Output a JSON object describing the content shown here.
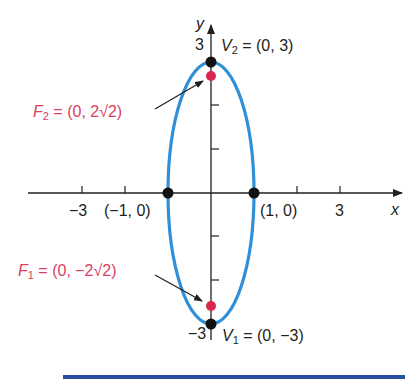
{
  "colors": {
    "ellipse": "#2f8fd8",
    "focus": "#d9274f",
    "vertex": "#111111",
    "axis": "#231f20",
    "focus_label": "#d9405f",
    "bottom_bar": "#2a4f9e"
  },
  "axes": {
    "x_label": "x",
    "y_label": "y",
    "x_ticks": [
      {
        "value": -3,
        "label": "−3"
      },
      {
        "value": -2,
        "label": ""
      },
      {
        "value": 2,
        "label": ""
      },
      {
        "value": 3,
        "label": "3"
      }
    ],
    "y_ticks": [
      {
        "value": 3,
        "label": "3"
      },
      {
        "value": 2,
        "label": ""
      },
      {
        "value": 1,
        "label": ""
      },
      {
        "value": -1,
        "label": ""
      },
      {
        "value": -2,
        "label": ""
      },
      {
        "value": -3,
        "label": "−3"
      }
    ]
  },
  "ellipse": {
    "center": [
      0,
      0
    ],
    "semi_major_y": 3,
    "semi_minor_x": 1,
    "equation": "x^2 + y^2/9 = 1"
  },
  "points": {
    "v2": {
      "name": "V",
      "sub": "2",
      "coords": "= (0, 3)"
    },
    "v1": {
      "name": "V",
      "sub": "1",
      "coords": "= (0, −3)"
    },
    "f2": {
      "name": "F",
      "sub": "2",
      "coords": "= (0, 2√2)"
    },
    "f1": {
      "name": "F",
      "sub": "1",
      "coords": "= (0, −2√2)"
    },
    "left_vertex": {
      "label": "(−1, 0)"
    },
    "right_vertex": {
      "label": "(1, 0)"
    }
  }
}
